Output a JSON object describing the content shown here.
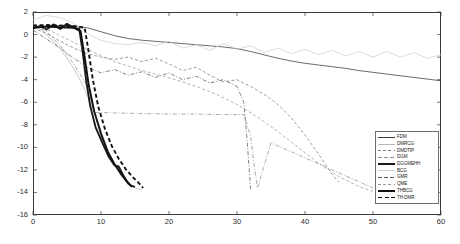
{
  "chart_data": {
    "type": "line",
    "title": "",
    "xlabel": "",
    "ylabel": "",
    "xlim": [
      0,
      60
    ],
    "ylim": [
      -16,
      2
    ],
    "xticks": [
      0,
      10,
      20,
      30,
      40,
      50,
      60
    ],
    "yticks": [
      2,
      0,
      -2,
      -4,
      -6,
      -8,
      -10,
      -12,
      -14,
      -16
    ],
    "grid": false,
    "legend_position": "lower-right",
    "series": [
      {
        "name": "FDM",
        "style": "solid",
        "width": "thin",
        "color": "#3a3a3a",
        "x": [
          0,
          2,
          4,
          6,
          8,
          10,
          12,
          14,
          16,
          18,
          20,
          22,
          24,
          26,
          28,
          30,
          32,
          34,
          36,
          38,
          40,
          42,
          44,
          46,
          48,
          50,
          52,
          54,
          56,
          58,
          60
        ],
        "y": [
          0.7,
          0.75,
          0.8,
          0.78,
          0.6,
          0.25,
          -0.1,
          -0.35,
          -0.5,
          -0.6,
          -0.7,
          -0.8,
          -0.9,
          -1.0,
          -1.1,
          -1.25,
          -1.5,
          -1.8,
          -2.1,
          -2.35,
          -2.55,
          -2.7,
          -2.85,
          -3.0,
          -3.2,
          -3.35,
          -3.5,
          -3.65,
          -3.8,
          -3.95,
          -4.1
        ]
      },
      {
        "name": "DMRCG",
        "style": "solid",
        "width": "thin",
        "color": "#b8b8b8",
        "x": [
          0,
          1,
          2,
          3,
          4,
          5,
          6,
          7,
          8,
          9,
          10,
          11,
          12,
          13,
          14,
          15,
          16
        ],
        "y": [
          0.9,
          0.5,
          0.0,
          -0.6,
          -1.3,
          -2.1,
          -3.0,
          -4.1,
          -5.4,
          -6.9,
          -8.5,
          -10.2,
          -11.6,
          -12.6,
          -13.2,
          -13.6,
          -13.8
        ]
      },
      {
        "name": "DMDTIP",
        "style": "dashed",
        "width": "thin",
        "color": "#7a7a7a",
        "x": [
          0,
          2,
          4,
          6,
          8,
          10,
          12,
          14,
          16,
          18,
          20,
          22,
          24,
          26,
          28,
          30,
          32,
          34,
          36,
          38,
          40,
          42,
          44,
          45
        ],
        "y": [
          0.6,
          0.1,
          -0.6,
          -1.2,
          -1.7,
          -2.0,
          -2.2,
          -2.0,
          -2.4,
          -2.1,
          -2.6,
          -3.2,
          -2.9,
          -3.6,
          -4.2,
          -4.0,
          -4.6,
          -5.3,
          -6.2,
          -7.4,
          -8.9,
          -10.6,
          -12.4,
          -13.1
        ]
      },
      {
        "name": "DGM",
        "style": "dashdot",
        "width": "thin",
        "color": "#8d8d8d",
        "x": [
          0,
          2,
          4,
          6,
          8,
          9,
          12,
          16,
          20,
          24,
          28,
          31,
          32,
          32.5,
          33,
          35,
          38,
          41,
          44,
          47,
          50
        ],
        "y": [
          0.8,
          0.3,
          -1.0,
          -2.6,
          -4.6,
          -6.9,
          -6.95,
          -7.0,
          -7.05,
          -7.05,
          -7.1,
          -7.1,
          -9.0,
          -11.5,
          -13.6,
          -9.6,
          -10.4,
          -11.2,
          -12.0,
          -12.8,
          -13.6
        ]
      },
      {
        "name": "DGGMEHH",
        "style": "solid",
        "width": "thick",
        "color": "#1a1a1a",
        "x": [
          0,
          1,
          2,
          3,
          4,
          5,
          6,
          6.8,
          7.3,
          7.8,
          8.4,
          9.2,
          10.2,
          11.2,
          12.0,
          12.6,
          13.2,
          13.8,
          14.4,
          15.0
        ],
        "y": [
          0.55,
          0.75,
          0.45,
          0.9,
          0.5,
          0.95,
          0.6,
          0.5,
          -1.5,
          -4.0,
          -6.3,
          -8.2,
          -9.6,
          -10.9,
          -11.6,
          -11.7,
          -12.4,
          -13.0,
          -13.4,
          -13.5
        ]
      },
      {
        "name": "BCG",
        "style": "solid",
        "width": "thin",
        "color": "#cfcfcf",
        "x": [
          0,
          2,
          4,
          6,
          8,
          10,
          12,
          14,
          16,
          18,
          20,
          22,
          24,
          26,
          28,
          30,
          32,
          34,
          36,
          38,
          40,
          42,
          44,
          46,
          48,
          50,
          52,
          54,
          56,
          58,
          60
        ],
        "y": [
          1.3,
          1.7,
          1.5,
          1.0,
          0.1,
          -0.5,
          -0.8,
          -0.9,
          -0.7,
          -1.0,
          -0.6,
          -1.2,
          -0.9,
          -1.4,
          -0.8,
          -1.3,
          -1.0,
          -1.6,
          -1.2,
          -1.7,
          -1.3,
          -1.8,
          -1.4,
          -1.9,
          -1.5,
          -2.0,
          -1.5,
          -2.0,
          -1.6,
          -2.1,
          -1.8
        ]
      },
      {
        "name": "GMR",
        "style": "dashdot",
        "width": "thin",
        "color": "#5a5a5a",
        "x": [
          0,
          2,
          4,
          6,
          8,
          10,
          12,
          14,
          16,
          18,
          20,
          22,
          24,
          26,
          28,
          30,
          31,
          31.5,
          32
        ],
        "y": [
          0.4,
          -0.4,
          -1.2,
          -2.1,
          -2.9,
          -3.4,
          -3.1,
          -3.6,
          -3.3,
          -3.8,
          -3.4,
          -4.0,
          -3.7,
          -4.3,
          -4.0,
          -4.6,
          -6.0,
          -9.5,
          -13.7
        ]
      },
      {
        "name": "QME",
        "style": "dashed",
        "width": "thin",
        "color": "#9a9a9a",
        "x": [
          0,
          3,
          6,
          9,
          12,
          15,
          18,
          21,
          24,
          27,
          30,
          33,
          36,
          39,
          42,
          45,
          48,
          50
        ],
        "y": [
          1.0,
          0.2,
          -0.7,
          -1.6,
          -2.4,
          -3.0,
          -3.5,
          -4.0,
          -4.6,
          -5.3,
          -6.2,
          -7.3,
          -8.6,
          -10.0,
          -11.4,
          -12.6,
          -13.5,
          -13.9
        ]
      },
      {
        "name": "THBCG",
        "style": "solid",
        "width": "thick",
        "color": "#111111",
        "x": [
          0,
          2,
          4,
          6,
          7.0,
          7.6,
          8.2,
          9.0,
          10.0,
          11.0,
          12.0,
          13.0,
          14.0,
          14.6
        ],
        "y": [
          0.6,
          0.7,
          0.65,
          0.6,
          0.3,
          -2.0,
          -4.5,
          -6.8,
          -8.8,
          -10.4,
          -11.5,
          -12.4,
          -13.2,
          -13.5
        ]
      },
      {
        "name": "TH-DMR",
        "style": "dashed",
        "width": "thick",
        "color": "#111111",
        "x": [
          0,
          2,
          4,
          6,
          7.6,
          8.2,
          8.8,
          9.6,
          10.6,
          11.6,
          12.6,
          13.6,
          14.6,
          15.6,
          16.2
        ],
        "y": [
          0.8,
          0.85,
          0.8,
          0.75,
          0.6,
          -1.6,
          -4.0,
          -6.4,
          -8.4,
          -9.9,
          -11.0,
          -11.9,
          -12.6,
          -13.2,
          -13.6
        ]
      }
    ]
  }
}
